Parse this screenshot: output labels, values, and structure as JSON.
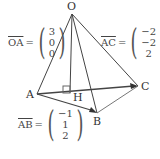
{
  "diagram": {
    "type": "tetrahedron-vectors",
    "points": {
      "O": {
        "label": "O",
        "x": 72,
        "y": 14
      },
      "A": {
        "label": "A",
        "x": 37,
        "y": 94
      },
      "B": {
        "label": "B",
        "x": 97,
        "y": 113
      },
      "C": {
        "label": "C",
        "x": 138,
        "y": 86
      },
      "H": {
        "label": "H",
        "x": 70,
        "y": 93
      }
    },
    "vectors": {
      "OA": {
        "name": "OA",
        "components": [
          "3",
          "0",
          "0"
        ]
      },
      "AC": {
        "name": "AC",
        "components": [
          "−2",
          "−2",
          "2"
        ]
      },
      "AB": {
        "name": "AB",
        "components": [
          "−1",
          "1",
          "2"
        ]
      }
    },
    "equals": "="
  }
}
